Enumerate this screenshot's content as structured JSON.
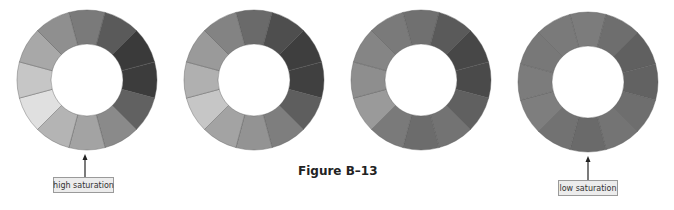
{
  "figure": {
    "caption": "Figure B–13"
  },
  "labels": {
    "high": "high saturation",
    "low": "low saturation"
  },
  "wheels": [
    {
      "name": "wheel-high-saturation",
      "cx": 87,
      "cy": 80,
      "r_outer": 70,
      "r_inner": 36,
      "segments": [
        "#7a7a7a",
        "#5a5a5a",
        "#3a3a3a",
        "#3c3c3c",
        "#616161",
        "#8a8a8a",
        "#a3a3a3",
        "#b4b4b4",
        "#e0e0e0",
        "#c6c6c6",
        "#a8a8a8",
        "#8f8f8f"
      ]
    },
    {
      "name": "wheel-medium-high-saturation",
      "cx": 254,
      "cy": 80,
      "r_outer": 70,
      "r_inner": 36,
      "segments": [
        "#6a6a6a",
        "#4e4e4e",
        "#3e3e3e",
        "#404040",
        "#5e5e5e",
        "#7e7e7e",
        "#939393",
        "#a3a3a3",
        "#c6c6c6",
        "#b0b0b0",
        "#9a9a9a",
        "#838383"
      ]
    },
    {
      "name": "wheel-medium-low-saturation",
      "cx": 421,
      "cy": 80,
      "r_outer": 70,
      "r_inner": 36,
      "segments": [
        "#707070",
        "#5a5a5a",
        "#474747",
        "#4a4a4a",
        "#606060",
        "#737373",
        "#6c6c6c",
        "#7a7a7a",
        "#9a9a9a",
        "#8e8e8e",
        "#858585",
        "#7a7a7a"
      ]
    },
    {
      "name": "wheel-low-saturation",
      "cx": 588,
      "cy": 82,
      "r_outer": 70,
      "r_inner": 36,
      "segments": [
        "#7c7c7c",
        "#6e6e6e",
        "#606060",
        "#626262",
        "#6e6e6e",
        "#747474",
        "#6a6a6a",
        "#727272",
        "#7e7e7e",
        "#7c7c7c",
        "#787878",
        "#7a7a7a"
      ]
    }
  ]
}
